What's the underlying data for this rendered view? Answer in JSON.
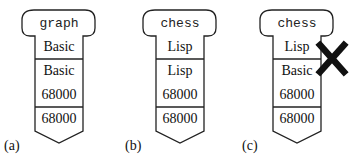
{
  "figure": {
    "panels": [
      {
        "label": "(a)",
        "header": "graph",
        "cells": [
          {
            "lines": [
              "Basic"
            ]
          },
          {
            "lines": [
              "Basic",
              "68000"
            ]
          },
          {
            "lines": [
              "68000"
            ]
          }
        ],
        "crossed": false
      },
      {
        "label": "(b)",
        "header": "chess",
        "cells": [
          {
            "lines": [
              "Lisp"
            ]
          },
          {
            "lines": [
              "Lisp",
              "68000"
            ]
          },
          {
            "lines": [
              "68000"
            ]
          }
        ],
        "crossed": false
      },
      {
        "label": "(c)",
        "header": "chess",
        "cells": [
          {
            "lines": [
              "Lisp"
            ]
          },
          {
            "lines": [
              "Basic",
              "68000"
            ]
          },
          {
            "lines": [
              "68000"
            ]
          }
        ],
        "crossed": true,
        "cross_mark": "mismatch-x"
      }
    ],
    "colors": {
      "stroke": "#222222",
      "cross": "#111111",
      "background": "#ffffff"
    }
  }
}
